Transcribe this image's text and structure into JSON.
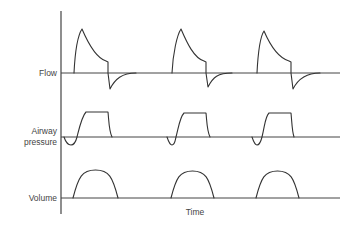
{
  "diagram": {
    "x_axis_label": "Time",
    "rows": [
      {
        "id": "flow",
        "label": "Flow",
        "label_lines": [
          "Flow"
        ],
        "baseline_y": 73
      },
      {
        "id": "pressure",
        "label": "Airway pressure",
        "label_lines": [
          "Airway",
          "pressure"
        ],
        "baseline_y": 137
      },
      {
        "id": "volume",
        "label": "Volume",
        "label_lines": [
          "Volume"
        ],
        "baseline_y": 198
      }
    ],
    "cycles": 3,
    "colors": {
      "line": "#333333",
      "label": "#444444",
      "background": "#ffffff"
    },
    "geometry": {
      "axis": {
        "x": 61,
        "y_top": 11,
        "y_bottom": 214
      },
      "baseline_x_end": 340,
      "flow_cycles": [
        {
          "start": 74,
          "peak": [
            82,
            29
          ],
          "decay_end": [
            108,
            62
          ],
          "neg_peak": [
            110,
            89
          ],
          "return": 136
        },
        {
          "start": 172,
          "peak": [
            181,
            29
          ],
          "decay_end": [
            206,
            62
          ],
          "neg_peak": [
            208,
            87
          ],
          "return": 232
        },
        {
          "start": 257,
          "peak": [
            264,
            31
          ],
          "decay_end": [
            291,
            62
          ],
          "neg_peak": [
            293,
            89
          ],
          "return": 320
        }
      ],
      "pressure_cycles": [
        {
          "dip_start": 64,
          "dip_bottom": [
            71,
            145
          ],
          "cross": 77,
          "plateau": [
            86,
            108
          ],
          "plateau_y": 112,
          "end": 112
        },
        {
          "dip_start": 167,
          "dip_bottom": [
            172,
            145
          ],
          "cross": 176,
          "plateau": [
            184,
            206
          ],
          "plateau_y": 113,
          "end": 210
        },
        {
          "dip_start": 252,
          "dip_bottom": [
            257,
            145
          ],
          "cross": 262,
          "plateau": [
            269,
            291
          ],
          "plateau_y": 113,
          "end": 294
        }
      ],
      "volume_cycles": [
        {
          "start": 73,
          "end": 118,
          "peak_y": 170
        },
        {
          "start": 171,
          "end": 214,
          "peak_y": 171
        },
        {
          "start": 256,
          "end": 299,
          "peak_y": 171
        }
      ]
    }
  }
}
